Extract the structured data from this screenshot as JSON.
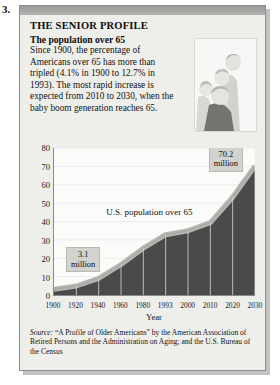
{
  "item_number": "3.",
  "panel": {
    "headline": "THE SENIOR PROFILE",
    "subhead": "The population over 65",
    "body": "Since 1900, the percentage of Americans over 65 has more than tripled (4.1% in 1900 to 12.7% in 1993). The most rapid increase is expected from 2010 to 2030, when the baby boom generation reaches 65.",
    "photo_alt": "family-photo"
  },
  "source": {
    "label": "Source:",
    "text": " “A Profile of Older Americans” by the American Association of Retired Persons and the Administration on Aging; and the U.S. Bureau of the Census"
  },
  "chart_data": {
    "type": "area",
    "title": "",
    "series_label": "U.S. population over 65",
    "xlabel": "Year",
    "ylabel": "",
    "categories": [
      "1900",
      "1920",
      "1940",
      "1960",
      "1980",
      "1993",
      "2000",
      "2010",
      "2020",
      "2030"
    ],
    "values": [
      3.1,
      4.9,
      9.0,
      16.6,
      25.5,
      32.8,
      35.0,
      39.4,
      53.2,
      70.2
    ],
    "xticks": [
      "1900",
      "1920",
      "1940",
      "1960",
      "1980",
      "1993",
      "2000",
      "2010",
      "2020",
      "2030"
    ],
    "yticks": [
      0,
      10,
      20,
      30,
      40,
      50,
      60,
      70,
      80
    ],
    "ylim": [
      0,
      80
    ],
    "grid": true,
    "legend": "none",
    "annotations": [
      {
        "name": "start-callout",
        "text_line1": "3.1",
        "text_line2": "million",
        "points_to": "1900"
      },
      {
        "name": "end-callout",
        "text_line1": "70.2",
        "text_line2": "million",
        "points_to": "2030"
      }
    ],
    "colors": {
      "area_fill": "#4a4a4a",
      "area_top": "#b5b5b1",
      "plot_background": "#fbfbfa",
      "axis": "#8a8a8a"
    }
  }
}
